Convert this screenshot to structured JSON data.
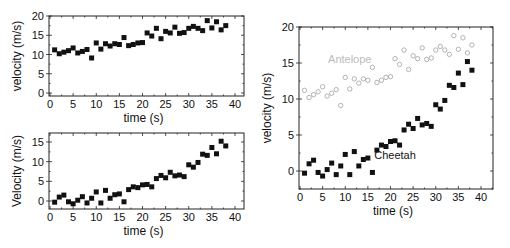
{
  "chart_data": [
    {
      "id": "top-left",
      "type": "scatter",
      "title": "",
      "xlabel": "time (s)",
      "ylabel": "velocity (m/s)",
      "xlim": [
        0,
        42.5
      ],
      "ylim": [
        0,
        20
      ],
      "xticks": [
        0,
        5,
        10,
        15,
        20,
        25,
        30,
        35,
        40
      ],
      "yticks": [
        0,
        5,
        10,
        15,
        20
      ],
      "grid": false,
      "legend": null,
      "series": [
        {
          "name": "Antelope",
          "marker": "filled-square",
          "color": "#111111",
          "x": [
            1,
            2,
            3,
            4,
            5,
            6,
            7,
            8,
            9,
            10,
            11,
            12,
            13,
            14,
            15,
            16,
            17,
            18,
            19,
            20,
            21,
            22,
            23,
            24,
            25,
            26,
            27,
            28,
            29,
            30,
            31,
            32,
            33,
            34,
            35,
            36,
            37,
            38
          ],
          "values": [
            11.2,
            10.2,
            10.6,
            11.0,
            11.7,
            10.4,
            10.8,
            11.3,
            9.1,
            13.0,
            11.4,
            12.8,
            12.2,
            12.8,
            12.6,
            14.4,
            12.3,
            12.6,
            13.0,
            13.1,
            15.6,
            14.8,
            16.8,
            14.1,
            16.0,
            15.6,
            17.1,
            15.5,
            15.7,
            16.8,
            17.3,
            16.8,
            16.2,
            18.8,
            16.9,
            18.5,
            16.4,
            17.5
          ]
        }
      ]
    },
    {
      "id": "bottom-left",
      "type": "scatter",
      "title": "",
      "xlabel": "time (s)",
      "ylabel": "Velocity (m/s)",
      "xlim": [
        0,
        42.5
      ],
      "ylim": [
        -2.5,
        17
      ],
      "xticks": [
        0,
        5,
        10,
        15,
        20,
        25,
        30,
        35,
        40
      ],
      "yticks": [
        0,
        5,
        10,
        15
      ],
      "grid": false,
      "legend": null,
      "series": [
        {
          "name": "Cheetah",
          "marker": "filled-square",
          "color": "#111111",
          "x": [
            1,
            2,
            3,
            4,
            5,
            6,
            7,
            8,
            9,
            10,
            11,
            12,
            13,
            14,
            15,
            16,
            17,
            18,
            19,
            20,
            21,
            22,
            23,
            24,
            25,
            26,
            27,
            28,
            29,
            30,
            31,
            32,
            33,
            34,
            35,
            36,
            37,
            38
          ],
          "values": [
            -0.3,
            1.0,
            1.5,
            -0.2,
            -0.7,
            0.2,
            1.1,
            -0.5,
            0.7,
            2.3,
            -0.5,
            2.7,
            0.7,
            1.6,
            1.8,
            -0.2,
            2.9,
            3.6,
            3.4,
            4.1,
            4.2,
            3.6,
            5.7,
            6.5,
            5.9,
            7.3,
            6.4,
            6.6,
            6.2,
            9.2,
            8.6,
            9.8,
            11.9,
            11.6,
            13.6,
            12.0,
            15.2,
            14.0
          ]
        }
      ]
    },
    {
      "id": "right",
      "type": "scatter",
      "title": "",
      "xlabel": "time (s)",
      "ylabel": "velocity (m/s)",
      "xlim": [
        0,
        42.5
      ],
      "ylim": [
        -2.5,
        20
      ],
      "xticks": [
        0,
        5,
        10,
        15,
        20,
        25,
        30,
        35,
        40
      ],
      "yticks": [
        0,
        5,
        10,
        15,
        20
      ],
      "grid": false,
      "legend": null,
      "annotations": [
        {
          "text": "Antelope",
          "x": 11,
          "y": 15,
          "color": "#bbbbbb"
        },
        {
          "text": "Cheetah",
          "x": 21,
          "y": 1.6,
          "color": "#111111"
        }
      ],
      "series": [
        {
          "name": "Antelope",
          "marker": "open-circle",
          "color": "#aaaaaa",
          "x": [
            1,
            2,
            3,
            4,
            5,
            6,
            7,
            8,
            9,
            10,
            11,
            12,
            13,
            14,
            15,
            16,
            17,
            18,
            19,
            20,
            21,
            22,
            23,
            24,
            25,
            26,
            27,
            28,
            29,
            30,
            31,
            32,
            33,
            34,
            35,
            36,
            37,
            38
          ],
          "values": [
            11.2,
            10.2,
            10.6,
            11.0,
            11.7,
            10.4,
            10.8,
            11.3,
            9.1,
            13.0,
            11.4,
            12.8,
            12.2,
            12.8,
            12.6,
            14.4,
            12.3,
            12.6,
            13.0,
            13.1,
            15.6,
            14.8,
            16.8,
            14.1,
            16.0,
            15.6,
            17.1,
            15.5,
            15.7,
            16.8,
            17.3,
            16.8,
            16.2,
            18.8,
            16.9,
            18.5,
            16.4,
            17.5
          ]
        },
        {
          "name": "Cheetah",
          "marker": "filled-square",
          "color": "#111111",
          "x": [
            1,
            2,
            3,
            4,
            5,
            6,
            7,
            8,
            9,
            10,
            11,
            12,
            13,
            14,
            15,
            16,
            17,
            18,
            19,
            20,
            21,
            22,
            23,
            24,
            25,
            26,
            27,
            28,
            29,
            30,
            31,
            32,
            33,
            34,
            35,
            36,
            37,
            38
          ],
          "values": [
            -0.3,
            1.0,
            1.5,
            -0.2,
            -0.7,
            0.2,
            1.1,
            -0.5,
            0.7,
            2.3,
            -0.5,
            2.7,
            0.7,
            1.6,
            1.8,
            -0.2,
            2.9,
            3.6,
            3.4,
            4.1,
            4.2,
            3.6,
            5.7,
            6.5,
            5.9,
            7.3,
            6.4,
            6.6,
            6.2,
            9.2,
            8.6,
            9.8,
            11.9,
            11.6,
            13.6,
            12.0,
            15.2,
            14.0
          ]
        }
      ]
    }
  ],
  "layout": {
    "panels": [
      {
        "id": "top-left",
        "frame": [
          49,
          16,
          244,
          96
        ],
        "x0px": 50,
        "x40px": 235,
        "yTopVal": 20,
        "yTopPx": 16,
        "yBotVal": 0,
        "yBotPx": 93
      },
      {
        "id": "bottom-left",
        "frame": [
          49,
          133,
          244,
          209
        ],
        "x0px": 50,
        "x40px": 235,
        "yTopVal": 15,
        "yTopPx": 142,
        "yBotVal": 0,
        "yBotPx": 201
      },
      {
        "id": "right",
        "frame": [
          299,
          27,
          493,
          189
        ],
        "x0px": 300,
        "x40px": 481,
        "yTopVal": 20,
        "yTopPx": 27,
        "yBotVal": 0,
        "yBotPx": 171
      }
    ]
  }
}
